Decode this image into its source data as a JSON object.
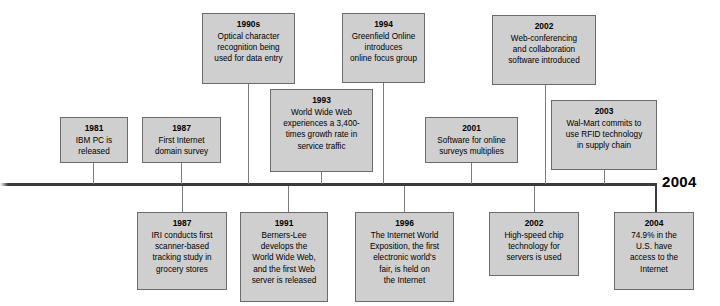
{
  "figure": {
    "kind": "timeline-diagram",
    "axis": {
      "end_label": "2004"
    },
    "colors": {
      "box_fill": "#cfcfcf",
      "box_border": "#6b6b6b",
      "axis": "#3b3b3b",
      "connector": "#7c7c7c",
      "text": "#000000",
      "background": "#ffffff"
    }
  },
  "events": [
    {
      "id": "1981-ibm-pc",
      "year": "1981",
      "desc": "IBM PC is\nreleased",
      "position": "above"
    },
    {
      "id": "1987-first-internet-domain-survey",
      "year": "1987",
      "desc": "First Internet\ndomain survey",
      "position": "above"
    },
    {
      "id": "1990s-optical-character-recognition",
      "year": "1990s",
      "desc": "Optical character\nrecognition being\nused for data entry",
      "position": "above"
    },
    {
      "id": "1993-world-wide-web-growth",
      "year": "1993",
      "desc": "World Wide Web\nexperiences a 3,400-\ntimes growth rate in\nservice traffic",
      "position": "above"
    },
    {
      "id": "1994-greenfield-online",
      "year": "1994",
      "desc": "Greenfield Online\nintroduces\nonline focus group",
      "position": "above"
    },
    {
      "id": "2001-survey-software-multiplies",
      "year": "2001",
      "desc": "Software for online\nsurveys multiplies",
      "position": "above"
    },
    {
      "id": "2002-web-conferencing",
      "year": "2002",
      "desc": "Web-conferencing\nand collaboration\nsoftware introduced",
      "position": "above"
    },
    {
      "id": "2003-walmart-rfid",
      "year": "2003",
      "desc": "Wal-Mart commits to\nuse RFID technology\nin supply chain",
      "position": "above"
    },
    {
      "id": "1987-iri-scanner-study",
      "year": "1987",
      "desc": "IRI conducts first\nscanner-based\ntracking study in\ngrocery stores",
      "position": "below"
    },
    {
      "id": "1991-berners-lee-www",
      "year": "1991",
      "desc": "Berners-Lee\ndevelops the\nWorld Wide Web,\nand the first Web\nserver is released",
      "position": "below"
    },
    {
      "id": "1996-internet-world-exposition",
      "year": "1996",
      "desc": "The Internet World\nExposition, the first\nelectronic world's\nfair, is held on\nthe Internet",
      "position": "below"
    },
    {
      "id": "2002-high-speed-chip",
      "year": "2002",
      "desc": "High-speed chip\ntechnology for\nservers is used",
      "position": "below"
    },
    {
      "id": "2004-us-internet-access",
      "year": "2004",
      "desc": "74.9% in the\nU.S. have\naccess to the\nInternet",
      "position": "below"
    }
  ]
}
